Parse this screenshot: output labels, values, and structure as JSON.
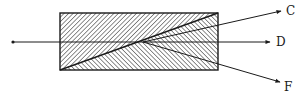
{
  "diagram": {
    "prism": {
      "x": 60,
      "y": 13,
      "width": 158,
      "height": 57,
      "upper_wedge_hatch": "backslash",
      "lower_wedge_hatch": "slash"
    },
    "incident_ray": {
      "x1": 12,
      "y1": 42,
      "x2": 143,
      "y2": 42
    },
    "split_point": {
      "x": 143,
      "y": 42
    },
    "rays": [
      {
        "id": "C",
        "label": "C",
        "x2": 281,
        "y2": 11
      },
      {
        "id": "D",
        "label": "D",
        "x2": 270,
        "y2": 42
      },
      {
        "id": "F",
        "label": "F",
        "x2": 280,
        "y2": 82
      }
    ],
    "labels": {
      "C": "C",
      "D": "D",
      "F": "F"
    },
    "colors": {
      "line": "#1a1a1a",
      "hatch": "#333333",
      "background": "#ffffff"
    }
  }
}
